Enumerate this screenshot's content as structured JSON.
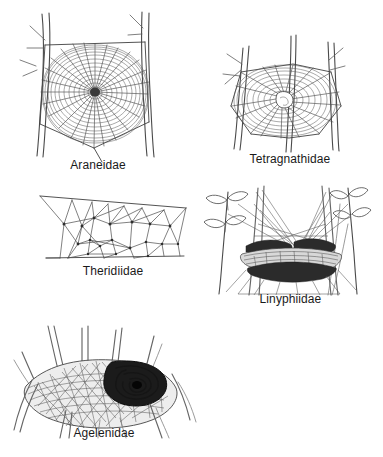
{
  "figure": {
    "background_color": "#ffffff",
    "ink_color": "#4a4a4a",
    "label_color": "#1a1a1a",
    "width": 383,
    "height": 457,
    "medium": "pen-and-ink line drawing"
  },
  "panels": [
    {
      "id": "araneidae",
      "label": "Araneidae",
      "web_type": "orb web",
      "description": "Vertical circular orb web with radiating spokes and a dense sticky spiral, strung between two upright twigs",
      "support": "two vertical twigs with small side shoots",
      "radii_count": 26,
      "spiral_turns": 22,
      "hub": "dense dark center"
    },
    {
      "id": "tetragnathidae",
      "label": "Tetragnathidae",
      "web_type": "orb web with open hub",
      "description": "Tilted orb web with an open hole at the hub, slung among upright grass stems",
      "support": "three to four slender stems",
      "radii_count": 18,
      "spiral_turns": 14,
      "hub": "open central hole"
    },
    {
      "id": "theridiidae",
      "label": "Theridiidae",
      "web_type": "tangle / cobweb",
      "description": "Irregular three-dimensional tangle of straight threads meeting at scattered junction knots between two horizontal support lines",
      "support": "upper and lower horizontal support threads",
      "node_count": 26
    },
    {
      "id": "linyphiidae",
      "label": "Linyphiidae",
      "web_type": "sheet / hammock web",
      "description": "Horizontal hammock-shaped sheet web with a dense dark sheet and scaffolding knock-down lines above, built among leafy plant sprigs",
      "support": "leafy plant stems with opposite oval leaves",
      "sheet_layers": 3
    },
    {
      "id": "agelenidae",
      "label": "Agelenidae",
      "web_type": "funnel web",
      "description": "Flat horizontal sheet of silk among grass blades with a dark spiral funnel retreat at one side",
      "support": "blades of grass",
      "funnel_position": "upper right of sheet"
    }
  ]
}
